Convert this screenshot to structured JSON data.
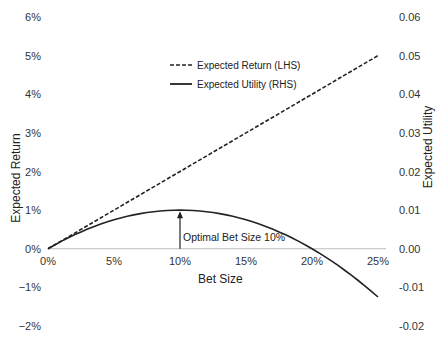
{
  "chart_data": {
    "type": "line",
    "title": "",
    "xlabel": "Bet Size",
    "ylabel": "Expected Return",
    "y2label": "Expected Utility",
    "x_ticks": [
      "0%",
      "5%",
      "10%",
      "15%",
      "20%",
      "25%"
    ],
    "x_range": [
      0,
      25
    ],
    "y_ticks": [
      "6%",
      "5%",
      "4%",
      "3%",
      "2%",
      "1%",
      "0%",
      "−1%",
      "−2%"
    ],
    "ylim": [
      -2,
      6
    ],
    "y2_ticks": [
      "0.06",
      "0.05",
      "0.04",
      "0.03",
      "0.02",
      "0.01",
      "0.00",
      "-0.01",
      "-0.02"
    ],
    "y2lim": [
      -0.02,
      0.06
    ],
    "x": [
      0,
      2.5,
      5,
      7.5,
      10,
      12.5,
      15,
      17.5,
      20,
      22.5,
      25
    ],
    "series": [
      {
        "name": "Expected Return (LHS)",
        "axis": "left",
        "style": "dashed",
        "unit": "%",
        "values": [
          0,
          0.5,
          1.0,
          1.5,
          2.0,
          2.5,
          3.0,
          3.5,
          4.0,
          4.5,
          5.0
        ]
      },
      {
        "name": "Expected Utility (RHS)",
        "axis": "right",
        "style": "solid",
        "values": [
          0,
          0.004375,
          0.0075,
          0.009375,
          0.01,
          0.009375,
          0.0075,
          0.004375,
          0,
          -0.005625,
          -0.0125
        ]
      }
    ],
    "annotations": [
      {
        "text": "Optimal Bet Size 10%",
        "x": 10,
        "y2": 0.01,
        "type": "arrow"
      }
    ],
    "legend": {
      "position": "upper-center",
      "entries": [
        "Expected Return (LHS)",
        "Expected Utility (RHS)"
      ]
    },
    "grid": false
  },
  "legend": {
    "return_label": "Expected Return (LHS)",
    "utility_label": "Expected Utility (RHS)"
  },
  "axes": {
    "x_title": "Bet Size",
    "y_title": "Expected Return",
    "y2_title": "Expected Utility"
  },
  "annotation": {
    "text": "Optimal Bet Size 10%"
  }
}
